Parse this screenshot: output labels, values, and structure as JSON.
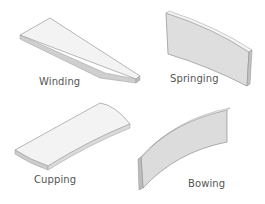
{
  "diagram": {
    "items": [
      {
        "id": "winding",
        "label": "Winding"
      },
      {
        "id": "springing",
        "label": "Springing"
      },
      {
        "id": "cupping",
        "label": "Cupping"
      },
      {
        "id": "bowing",
        "label": "Bowing"
      }
    ],
    "colors": {
      "face": "#f2f2f2",
      "face_shaded": "#dcdcdc",
      "edge": "#c4c4c4",
      "outline": "#8a8a8a",
      "label": "#555555",
      "background": "#ffffff"
    }
  }
}
